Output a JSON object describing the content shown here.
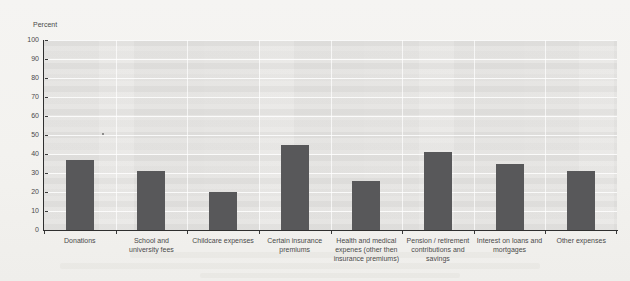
{
  "chart_data": {
    "type": "bar",
    "title": "",
    "ylabel": "Percent",
    "xlabel": "",
    "categories": [
      "Donations",
      "School and\nuniversity fees",
      "Childcare expenses",
      "Certain insurance\npremiums",
      "Health and medical\nexpenes (other then\ninsurance premiums)",
      "Pension / retirement\ncontributions and\nsavings",
      "Interest on loans and\nmortgages",
      "Other expenses"
    ],
    "values": [
      37,
      31,
      20,
      45,
      26,
      41,
      35,
      31
    ],
    "ylim": [
      0,
      100
    ],
    "yticks": [
      0,
      10,
      20,
      30,
      40,
      50,
      60,
      70,
      80,
      90,
      100
    ],
    "grid": true,
    "legend": null,
    "bar_color": "#58585a",
    "axis_color": "#2f2f2f",
    "text_color": "#4a4a4a",
    "page_background": "#f3f2ef",
    "plot_background": "#e9e8e6"
  }
}
